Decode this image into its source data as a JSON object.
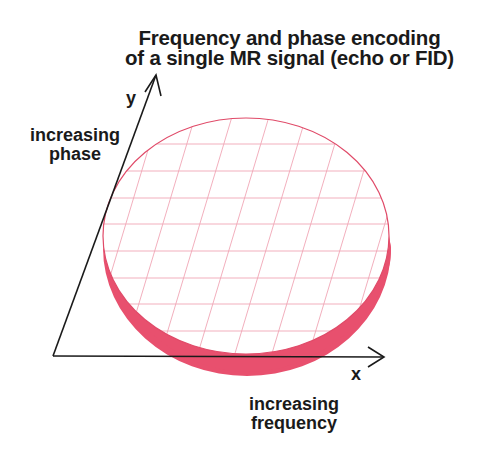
{
  "title": {
    "line1": "Frequency and phase encoding",
    "line2": "of a single MR signal (echo or FID)"
  },
  "axes": {
    "y": {
      "letter": "y",
      "label_line1": "increasing",
      "label_line2": "phase"
    },
    "x": {
      "letter": "x",
      "label_line1": "increasing",
      "label_line2": "frequency"
    }
  },
  "colors": {
    "disc_edge": "#e8506e",
    "grid": "#f0a6b6",
    "axis": "#1a1a1a"
  }
}
